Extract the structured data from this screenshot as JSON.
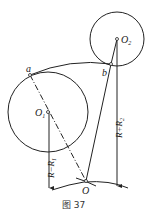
{
  "diagram": {
    "caption": "图 37",
    "labels": {
      "a": "a",
      "b": "b",
      "O1": "O",
      "O1_sub": "1",
      "O2": "O",
      "O2_sub": "2",
      "O": "O",
      "r_minus": "R−R",
      "r_minus_sub": "1",
      "r_plus": "R+R",
      "r_plus_sub": "2"
    },
    "colors": {
      "stroke": "#222222",
      "background": "#ffffff"
    }
  }
}
